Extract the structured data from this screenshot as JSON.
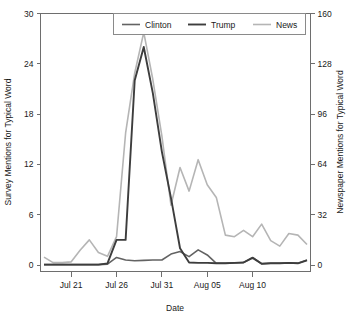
{
  "chart_data": {
    "type": "line",
    "title": "",
    "xlabel": "Date",
    "ylabel": "Survey Mentions for Typical Word",
    "y2label": "Newspaper Mentions for Typical Word",
    "grid": false,
    "legend_position": "top-center",
    "xlim": [
      0,
      29
    ],
    "ylim": [
      0,
      30
    ],
    "y2lim": [
      0,
      160
    ],
    "yticks": [
      0,
      6,
      12,
      18,
      24,
      30
    ],
    "yticklabels": [
      "0",
      "6",
      "12",
      "18",
      "24",
      "30"
    ],
    "y2ticks": [
      0,
      32,
      64,
      96,
      128,
      160
    ],
    "y2ticklabels": [
      "0",
      "32",
      "64",
      "96",
      "128",
      "160"
    ],
    "xticks": [
      3,
      8,
      13,
      18,
      23
    ],
    "xticklabels": [
      "Jul 21",
      "Jul 26",
      "Jul 31",
      "Aug 05",
      "Aug 10"
    ],
    "x": [
      0,
      1,
      2,
      3,
      4,
      5,
      6,
      7,
      8,
      9,
      10,
      11,
      12,
      13,
      14,
      15,
      16,
      17,
      18,
      19,
      20,
      21,
      22,
      23,
      24,
      25,
      26,
      27,
      28,
      29
    ],
    "series": [
      {
        "name": "Clinton",
        "axis": "left",
        "color": "#636363",
        "width": 1.6,
        "values": [
          0.05,
          0.05,
          0.05,
          0.05,
          0.05,
          0.05,
          0.05,
          0.1,
          0.9,
          0.6,
          0.5,
          0.55,
          0.6,
          0.6,
          1.3,
          1.6,
          1.0,
          1.8,
          1.2,
          0.2,
          0.2,
          0.25,
          0.3,
          0.9,
          0.15,
          0.2,
          0.2,
          0.25,
          0.2,
          0.6
        ]
      },
      {
        "name": "Trump",
        "axis": "left",
        "color": "#3d3d3d",
        "width": 1.9,
        "values": [
          0.05,
          0.05,
          0.05,
          0.05,
          0.05,
          0.05,
          0.05,
          0.2,
          3.0,
          3.0,
          22.0,
          26.0,
          20.5,
          13.5,
          8.0,
          2.0,
          0.3,
          0.25,
          0.25,
          0.2,
          0.2,
          0.25,
          0.3,
          0.85,
          0.15,
          0.2,
          0.2,
          0.25,
          0.2,
          0.55
        ]
      },
      {
        "name": "News",
        "axis": "right",
        "color": "#b5b5b5",
        "width": 1.6,
        "values": [
          5,
          1.5,
          1.5,
          2.0,
          9.5,
          16.0,
          8.0,
          5.5,
          18.0,
          84.0,
          122.0,
          148.0,
          118.0,
          82.0,
          38.0,
          62.0,
          47.0,
          67.0,
          51.0,
          43.0,
          19.0,
          18.0,
          22.0,
          18.0,
          26.0,
          15.5,
          12.0,
          20.0,
          19.0,
          13.0
        ]
      }
    ]
  },
  "legend": {
    "entries": [
      {
        "label": "Clinton"
      },
      {
        "label": "Trump"
      },
      {
        "label": "News"
      }
    ]
  },
  "axes": {
    "x_title": "Date",
    "y_left_title": "Survey Mentions for Typical Word",
    "y_right_title": "Newspaper Mentions for Typical Word"
  }
}
